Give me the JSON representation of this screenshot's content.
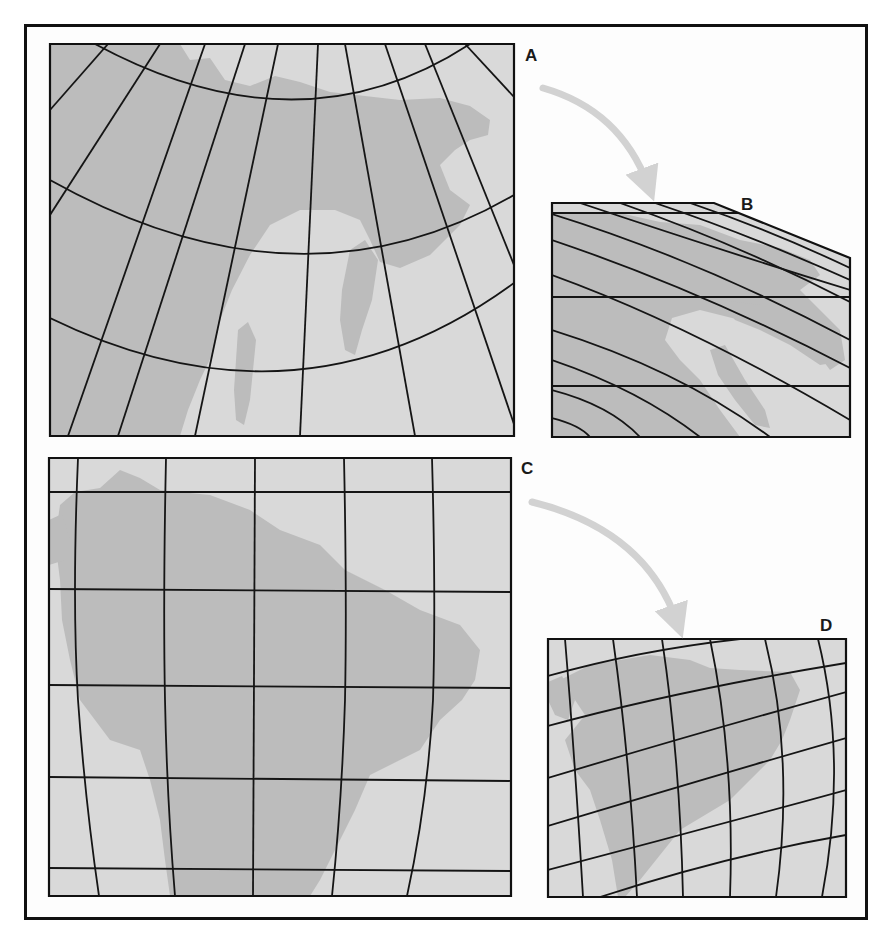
{
  "figure": {
    "colors": {
      "background": "#ffffff",
      "frame": "#111111",
      "ocean": "#d9d9d9",
      "land": "#bcbcbc",
      "graticule": "#151515",
      "arrow": "#d2d2d2",
      "label": "#1a1a1a"
    }
  },
  "labels": {
    "A": {
      "text": "A",
      "x": 525,
      "y": 47
    },
    "B": {
      "text": "B",
      "x": 741,
      "y": 196
    },
    "C": {
      "text": "C",
      "x": 521,
      "y": 460
    },
    "D": {
      "text": "D",
      "x": 820,
      "y": 617
    }
  },
  "arrows": [
    {
      "name": "arrow-a-to-b",
      "path": "M543 88 Q620 110 648 185"
    },
    {
      "name": "arrow-c-to-d",
      "path": "M532 502 Q645 530 677 622"
    }
  ],
  "panels": {
    "A": {
      "clip": "M50 44 L514 44 L514 436 L50 436 Z",
      "land": [
        "M50 44 L180 44 L190 60 L210 58 L225 80 L250 86 L275 76 L300 82 L330 92 L365 96 L400 100 L440 98 L470 106 L490 120 L488 135 L470 140 L455 150 L440 165 L450 190 L470 205 L460 225 L430 255 L400 268 L380 262 L370 240 L360 220 L335 210 L300 210 L270 225 L250 255 L232 290 L220 320 L212 355 L200 380 L188 410 L180 436 L50 436 Z",
        "M350 250 L365 240 L378 260 L372 300 L362 330 L355 355 L345 350 L340 320 L342 290 Z",
        "M238 330 L248 322 L256 340 L253 370 L250 400 L244 425 L236 420 L234 390 L236 360 Z"
      ],
      "parallels": [
        "M50 116 Q300 -60 514 60",
        "M50 200 Q120 160 150 170 Q300 220 514 130",
        "M50 330 Q300 420 514 285"
      ],
      "parallel_curves": [
        "M95 44 Q300 155 470 44",
        "M50 180 Q300 320 514 195",
        "M50 318 Q300 440 514 283"
      ],
      "meridians": [
        "M108 44 L50 110",
        "M160 44 L50 215",
        "M205 44 L68 436",
        "M245 44 L118 436",
        "M278 44 L195 436",
        "M318 44 L300 436",
        "M345 44 L415 436",
        "M385 44 L518 436",
        "M425 44 L514 265",
        "M465 44 L514 97"
      ]
    },
    "B": {
      "clip": "M552 203 L714 203 L850 258 L850 437 L552 437 Z",
      "outline": "M552 203 L714 203 L850 258 L850 437 L552 437 Z",
      "land": [
        "M552 213 L620 213 L660 222 L700 225 L740 240 L780 248 L810 260 L820 275 L800 290 L820 310 L840 330 L845 360 L830 370 L815 350 L790 330 L770 320 L740 320 L700 310 L672 318 L665 340 L680 360 L700 380 L720 410 L740 437 L552 437 Z",
        "M720 300 L760 305 L800 325 L830 345 L838 362 L820 365 L790 345 L760 330 L735 320 Z",
        "M710 350 L725 345 L745 380 L765 410 L770 428 L755 425 L735 400 L718 375 Z"
      ],
      "horizontals": [
        {
          "y": 213,
          "x1": 552,
          "x2": 740
        },
        {
          "y": 297,
          "x1": 552,
          "x2": 850
        },
        {
          "y": 386,
          "x1": 552,
          "x2": 850
        }
      ],
      "curves": [
        "M580 203 Q720 250 850 290",
        "M620 203 Q740 245 850 302",
        "M655 203 Q750 235 850 280",
        "M690 203 Q770 230 850 268",
        "M552 214 Q700 260 850 340",
        "M552 240 Q700 290 850 368",
        "M552 275 Q690 325 850 420",
        "M552 330 Q680 370 770 437",
        "M552 360 Q640 390 700 437",
        "M552 418 Q580 425 590 437",
        "M552 390 Q610 405 640 437"
      ]
    },
    "C": {
      "clip": "M49 458 L511 458 L511 896 L49 896 Z",
      "land": [
        "M60 505 L75 492 L100 488 L120 470 L140 478 L160 490 L210 495 L250 510 L280 530 L320 545 L345 570 L385 590 L420 610 L460 625 L480 650 L475 680 L462 700 L440 720 L420 750 L400 760 L370 775 L355 810 L340 840 L320 880 L310 896 L170 896 L165 860 L160 820 L150 780 L140 750 L110 740 L95 720 L80 700 L70 660 L62 620 L60 580 L55 540 Z",
        "M49 520 L62 514 L70 540 L65 560 L49 565 Z"
      ],
      "horizontals": [
        {
          "path": "M49 492 L511 492"
        },
        {
          "path": "M49 589 L511 592"
        },
        {
          "path": "M49 685 L511 688"
        },
        {
          "path": "M49 777 L511 781"
        },
        {
          "path": "M49 868 L511 871"
        }
      ],
      "meridians": [
        "M78 458 Q72 600 78 700 Q85 800 99 896",
        "M166 458 Q163 600 165 700 Q167 800 175 896",
        "M255 458 L253 896",
        "M344 458 Q347 600 345 700 Q342 800 332 896",
        "M432 458 Q436 600 433 700 Q428 800 407 896"
      ]
    },
    "D": {
      "clip": "M548 639 L846 639 L846 897 L548 897 Z",
      "land": [
        "M560 680 L590 665 L620 660 L650 655 L690 660 L710 668 L740 670 L790 672 L800 690 L790 720 L782 740 L770 760 L750 780 L730 800 L705 815 L680 830 L660 855 L640 880 L625 897 L618 897 L612 860 L600 820 L590 790 L575 770 L565 740 L585 715 L575 700 Z",
        "M548 682 L562 676 L575 700 L568 720 L555 715 L548 700 Z"
      ],
      "parallels": [
        "M548 676 Q640 650 740 639",
        "M548 726 Q680 690 846 663",
        "M548 778 Q690 735 846 692",
        "M548 826 Q700 780 846 738",
        "M548 870 Q700 830 846 790",
        "M600 897 Q730 855 846 835"
      ],
      "meridians": [
        "M565 639 Q575 760 583 897",
        "M613 639 Q630 760 637 897",
        "M662 639 Q680 760 683 897",
        "M710 639 Q735 760 730 897",
        "M765 639 Q795 760 776 897",
        "M818 639 Q848 760 822 897"
      ]
    }
  }
}
